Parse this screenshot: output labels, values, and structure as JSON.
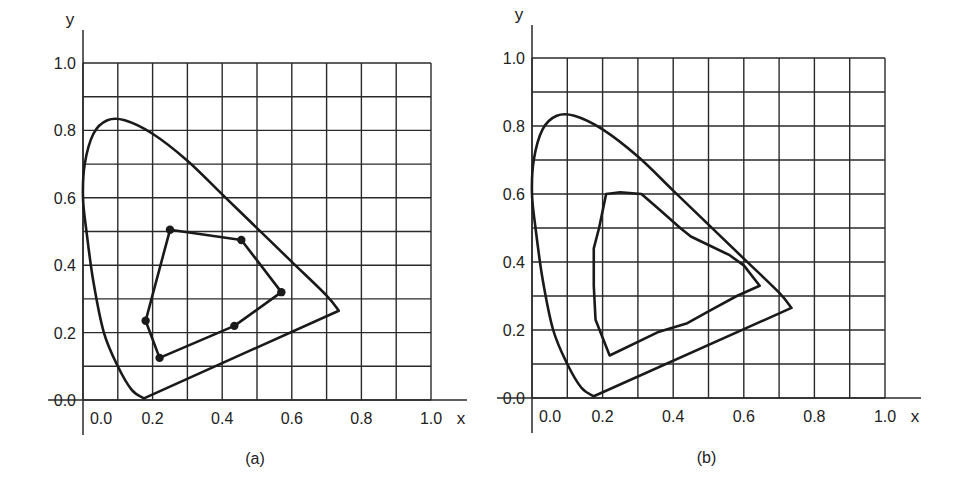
{
  "panels": [
    {
      "id": "a",
      "caption": "(a)",
      "x_axis_label": "x",
      "y_axis_label": "y",
      "x_ticks": [
        "0.0",
        "0.2",
        "0.4",
        "0.6",
        "0.8",
        "1.0"
      ],
      "y_ticks": [
        "0.0",
        "0.2",
        "0.4",
        "0.6",
        "0.8",
        "1.0"
      ]
    },
    {
      "id": "b",
      "caption": "(b)",
      "x_axis_label": "x",
      "y_axis_label": "y",
      "x_ticks": [
        "0.0",
        "0.2",
        "0.4",
        "0.6",
        "0.8",
        "1.0"
      ],
      "y_ticks": [
        "0.0",
        "0.2",
        "0.4",
        "0.6",
        "0.8",
        "1.0"
      ]
    }
  ],
  "chart_data": [
    {
      "type": "line",
      "title": "(a)",
      "xlabel": "x",
      "ylabel": "y",
      "xlim": [
        0.0,
        1.0
      ],
      "ylim": [
        0.0,
        1.0
      ],
      "grid": true,
      "grid_step": 0.1,
      "series": [
        {
          "name": "spectral locus (chromaticity horseshoe)",
          "closed": true,
          "points": [
            [
              0.175,
              0.005
            ],
            [
              0.14,
              0.03
            ],
            [
              0.1,
              0.1
            ],
            [
              0.06,
              0.2
            ],
            [
              0.03,
              0.35
            ],
            [
              0.01,
              0.5
            ],
            [
              0.0,
              0.6
            ],
            [
              0.005,
              0.7
            ],
            [
              0.03,
              0.79
            ],
            [
              0.07,
              0.83
            ],
            [
              0.12,
              0.83
            ],
            [
              0.2,
              0.79
            ],
            [
              0.3,
              0.71
            ],
            [
              0.4,
              0.61
            ],
            [
              0.5,
              0.51
            ],
            [
              0.6,
              0.41
            ],
            [
              0.7,
              0.31
            ],
            [
              0.735,
              0.265
            ]
          ]
        },
        {
          "name": "gamut polygon (markers)",
          "closed": true,
          "markers": true,
          "points": [
            [
              0.25,
              0.505
            ],
            [
              0.455,
              0.475
            ],
            [
              0.57,
              0.32
            ],
            [
              0.435,
              0.22
            ],
            [
              0.22,
              0.125
            ],
            [
              0.18,
              0.235
            ]
          ]
        }
      ]
    },
    {
      "type": "line",
      "title": "(b)",
      "xlabel": "x",
      "ylabel": "y",
      "xlim": [
        0.0,
        1.0
      ],
      "ylim": [
        0.0,
        1.0
      ],
      "grid": true,
      "grid_step": 0.1,
      "series": [
        {
          "name": "spectral locus (chromaticity horseshoe)",
          "closed": true,
          "points": [
            [
              0.175,
              0.005
            ],
            [
              0.14,
              0.03
            ],
            [
              0.1,
              0.1
            ],
            [
              0.06,
              0.2
            ],
            [
              0.03,
              0.35
            ],
            [
              0.01,
              0.5
            ],
            [
              0.0,
              0.6
            ],
            [
              0.005,
              0.7
            ],
            [
              0.03,
              0.79
            ],
            [
              0.07,
              0.83
            ],
            [
              0.12,
              0.83
            ],
            [
              0.2,
              0.79
            ],
            [
              0.3,
              0.71
            ],
            [
              0.4,
              0.61
            ],
            [
              0.5,
              0.51
            ],
            [
              0.6,
              0.41
            ],
            [
              0.7,
              0.31
            ],
            [
              0.735,
              0.265
            ]
          ]
        },
        {
          "name": "gamut region (smooth boundary)",
          "closed": true,
          "markers": false,
          "points": [
            [
              0.21,
              0.6
            ],
            [
              0.25,
              0.605
            ],
            [
              0.31,
              0.6
            ],
            [
              0.36,
              0.555
            ],
            [
              0.42,
              0.5
            ],
            [
              0.45,
              0.475
            ],
            [
              0.5,
              0.45
            ],
            [
              0.56,
              0.42
            ],
            [
              0.6,
              0.39
            ],
            [
              0.645,
              0.33
            ],
            [
              0.58,
              0.3
            ],
            [
              0.5,
              0.255
            ],
            [
              0.44,
              0.22
            ],
            [
              0.36,
              0.195
            ],
            [
              0.22,
              0.125
            ],
            [
              0.18,
              0.23
            ],
            [
              0.175,
              0.33
            ],
            [
              0.175,
              0.44
            ],
            [
              0.19,
              0.5
            ]
          ]
        }
      ]
    }
  ]
}
